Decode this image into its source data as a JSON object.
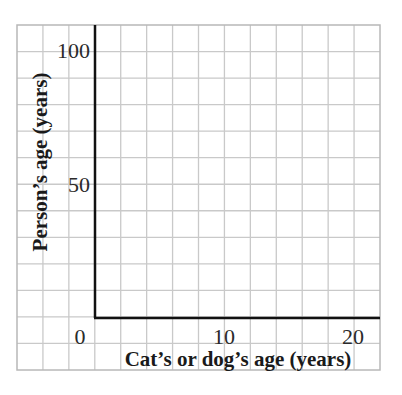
{
  "chart_data": {
    "type": "line",
    "title": "",
    "xlabel": "Cat’s or dog’s age (years)",
    "ylabel": "Person’s age (years)",
    "x_ticks": [
      {
        "value": 0,
        "label": "0"
      },
      {
        "value": 10,
        "label": "10"
      },
      {
        "value": 20,
        "label": "20"
      }
    ],
    "y_ticks": [
      {
        "value": 50,
        "label": "50"
      },
      {
        "value": 100,
        "label": "100"
      }
    ],
    "xlim": [
      0,
      22
    ],
    "ylim": [
      0,
      110
    ],
    "grid": true,
    "grid_x_step": 2,
    "grid_y_step": 10,
    "series": [],
    "legend": null,
    "colors": {
      "grid": "#c9c9c9",
      "grid_border": "#b8b8b8",
      "axis": "#111111",
      "text": "#1a1a1a"
    }
  }
}
